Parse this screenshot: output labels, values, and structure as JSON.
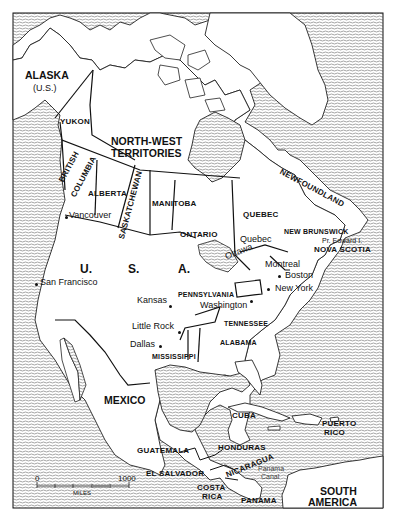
{
  "map": {
    "title": "North America",
    "header_partial": "",
    "caption_partial": "",
    "regions": {
      "alaska": "ALASKA",
      "alaska_sub": "(U.S.)",
      "yukon": "YUKON",
      "nwt_1": "NORTH-WEST",
      "nwt_2": "TERRITORIES",
      "bc_1": "BRITISH",
      "bc_2": "COLUMBIA",
      "alberta": "ALBERTA",
      "saskatchewan": "SASKATCHEWAN",
      "manitoba": "MANITOBA",
      "ontario": "ONTARIO",
      "quebec": "QUEBEC",
      "newfoundland": "NEWFOUNDLAND",
      "new_brunswick": "NEW BRUNSWICK",
      "pei": "Pr. Edward I.",
      "nova_scotia": "NOVA SCOTIA",
      "usa_u": "U.",
      "usa_s": "S.",
      "usa_a": "A.",
      "pennsylvania": "PENNSYLVANIA",
      "tennessee": "TENNESSEE",
      "alabama": "ALABAMA",
      "mississippi": "MISSISSIPPI",
      "mexico": "MEXICO",
      "cuba": "CUBA",
      "puerto_rico_1": "PUERTO",
      "puerto_rico_2": "RICO",
      "guatemala": "GUATEMALA",
      "honduras": "HONDURAS",
      "el_salvador": "EL SALVADOR",
      "nicaragua": "NICARAGUA",
      "costa_rica_1": "COSTA",
      "costa_rica_2": "RICA",
      "panama": "PANAMA",
      "panama_canal_1": "Panama",
      "panama_canal_2": "Canal",
      "south_america_1": "SOUTH",
      "south_america_2": "AMERICA"
    },
    "cities": {
      "vancouver": "Vancouver",
      "san_francisco": "San Francisco",
      "kansas": "Kansas",
      "little_rock": "Little Rock",
      "dallas": "Dallas",
      "washington": "Washington",
      "quebec": "Quebec",
      "ottawa": "Ottawa",
      "montreal": "Montreal",
      "boston": "Boston",
      "new_york": "New York"
    },
    "scale": {
      "start": "0",
      "end": "1000",
      "unit": "MILES"
    },
    "colors": {
      "land": "#ffffff",
      "water_line": "#555555",
      "border": "#111111"
    }
  }
}
